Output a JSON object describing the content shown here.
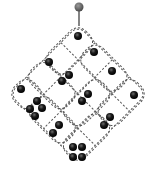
{
  "diagram": {
    "colors": {
      "background": "#ffffff",
      "dash_line": "#555555",
      "dot": "#1a1a1a",
      "dot_highlight": "#777777",
      "pin": "#666666",
      "pin_stem": "#333333"
    },
    "pin": {
      "x": 79,
      "y": 7,
      "stem_end_y": 26
    },
    "grid": {
      "cx": 78,
      "cy": 94,
      "half_diagonal": 69,
      "divisions": 4
    },
    "dot_groups": [
      {
        "name": "one-top",
        "count": 1,
        "dots": [
          [
            78,
            36
          ]
        ]
      },
      {
        "name": "one-upper-right",
        "count": 1,
        "dots": [
          [
            94,
            52
          ]
        ]
      },
      {
        "name": "one-upper-left",
        "count": 1,
        "dots": [
          [
            49,
            62
          ]
        ]
      },
      {
        "name": "one-right-mid",
        "count": 1,
        "dots": [
          [
            112,
            71
          ]
        ]
      },
      {
        "name": "two-upper-center",
        "count": 2,
        "dots": [
          [
            69,
            75
          ],
          [
            62,
            81
          ]
        ]
      },
      {
        "name": "one-left",
        "count": 1,
        "dots": [
          [
            21,
            89
          ]
        ]
      },
      {
        "name": "two-center",
        "count": 2,
        "dots": [
          [
            88,
            94
          ],
          [
            82,
            101
          ]
        ]
      },
      {
        "name": "one-right",
        "count": 1,
        "dots": [
          [
            134,
            95
          ]
        ]
      },
      {
        "name": "four-left",
        "count": 4,
        "dots": [
          [
            37,
            101
          ],
          [
            30,
            109
          ],
          [
            42,
            108
          ],
          [
            35,
            116
          ]
        ]
      },
      {
        "name": "two-lower-right",
        "count": 2,
        "dots": [
          [
            110,
            117
          ],
          [
            104,
            125
          ]
        ]
      },
      {
        "name": "two-lower-left",
        "count": 2,
        "dots": [
          [
            59,
            125
          ],
          [
            53,
            133
          ]
        ]
      },
      {
        "name": "four-bottom",
        "count": 4,
        "dots": [
          [
            73,
            147
          ],
          [
            82,
            147
          ],
          [
            73,
            157
          ],
          [
            82,
            157
          ]
        ]
      }
    ]
  }
}
